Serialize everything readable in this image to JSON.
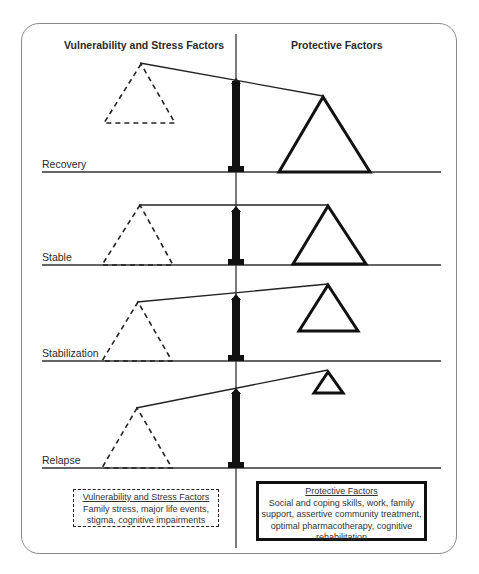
{
  "headers": {
    "left": "Vulnerability and Stress Factors",
    "right": "Protective Factors"
  },
  "rows": [
    {
      "label": "Recovery",
      "state": "protective outweighs vulnerability; beam tilts toward protective side"
    },
    {
      "label": "Stable",
      "state": "balanced; beam horizontal"
    },
    {
      "label": "Stabilization",
      "state": "protective triangle smaller; beam tilts up toward protective side"
    },
    {
      "label": "Relapse",
      "state": "protective triangle smallest; beam tilts strongly up toward protective side"
    }
  ],
  "legend": {
    "vulnerability": {
      "title": "Vulnerability and Stress Factors",
      "body": "Family stress, major life events, stigma, cognitive impairments",
      "style": "dashed-border"
    },
    "protective": {
      "title": "Protective Factors",
      "body": "Social and coping skills, work, family support, assertive community treatment, optimal pharmacotherapy, cognitive rehabilitation",
      "style": "solid-thick-border"
    }
  },
  "colors": {
    "frame_border": "#8a8a8a",
    "lines": "#222222",
    "pillar": "#111111",
    "background": "#ffffff"
  }
}
